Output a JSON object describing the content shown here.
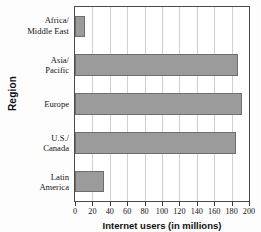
{
  "chart_data": {
    "type": "bar",
    "orientation": "horizontal",
    "title": "",
    "xlabel": "Internet users (in millions)",
    "ylabel": "Region",
    "categories": [
      "Africa/ Middle East",
      "Asia/ Pacific",
      "Europe",
      "U.S./ Canada",
      "Latin America"
    ],
    "category_lines": [
      [
        "Africa/",
        "Middle East"
      ],
      [
        "Asia/",
        "Pacific"
      ],
      [
        "Europe",
        ""
      ],
      [
        "U.S./",
        "Canada"
      ],
      [
        "Latin",
        "America"
      ]
    ],
    "values": [
      11,
      187,
      192,
      185,
      33
    ],
    "xlim": [
      0,
      200
    ],
    "xticks": [
      0,
      20,
      40,
      60,
      80,
      100,
      120,
      140,
      160,
      180,
      200
    ],
    "xtick_labels": [
      "0",
      "20",
      "40",
      "60",
      "80",
      "100",
      "120",
      "140",
      "160",
      "180",
      "200"
    ],
    "grid": true,
    "grid_axis": "x",
    "legend": false,
    "bar_color": "#9b9b9b",
    "bar_edge_color": "#6e6e6e",
    "grid_color": "#cfcfcf",
    "frame_color": "#4a4a4a"
  }
}
